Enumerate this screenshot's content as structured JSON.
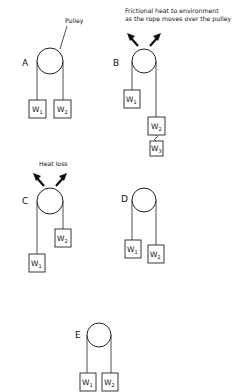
{
  "figure": {
    "panels": [
      {
        "id": "A",
        "label": "A",
        "annotation": "Pulley",
        "weights": [
          "W1",
          "W2"
        ]
      },
      {
        "id": "B",
        "label": "B",
        "annotation": "Frictional heat to environment as the rope moves over the pulley",
        "annotation_lines": [
          "Frictional  heat to environment",
          "as the rope  moves  over  the pulley"
        ],
        "weights": [
          "W1",
          "W2",
          "W3"
        ]
      },
      {
        "id": "C",
        "label": "C",
        "annotation": "Heat loss",
        "weights": [
          "W1",
          "W2"
        ]
      },
      {
        "id": "D",
        "label": "D",
        "weights": [
          "W1",
          "W2"
        ]
      },
      {
        "id": "E",
        "label": "E",
        "weights": [
          "W1",
          "W2"
        ]
      }
    ],
    "weight_base": "W",
    "subscripts": [
      "1",
      "2",
      "3"
    ]
  }
}
